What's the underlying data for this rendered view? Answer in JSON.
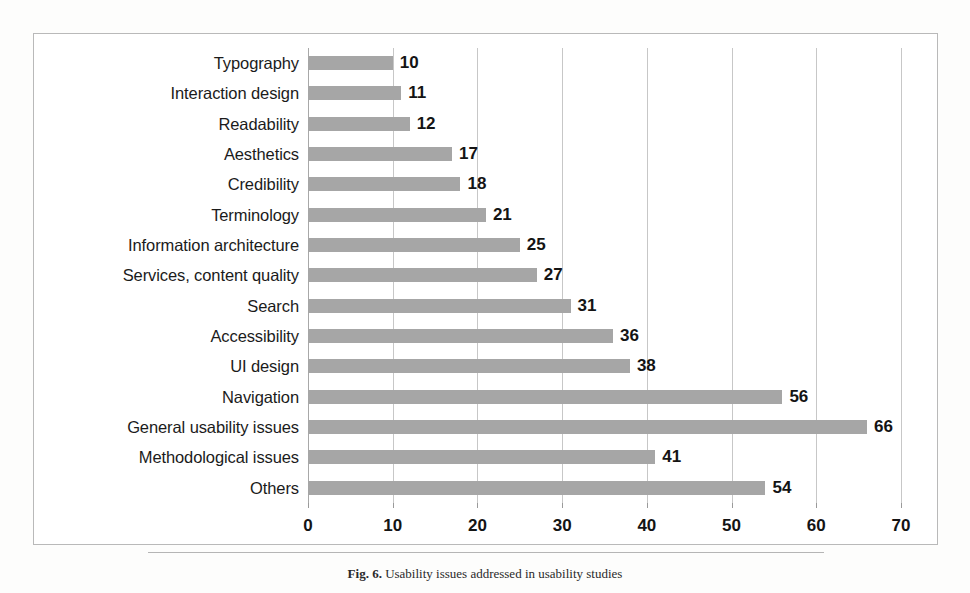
{
  "caption": {
    "figure_number": "Fig. 6.",
    "text": "Usability issues addressed in usability studies"
  },
  "chart_data": {
    "type": "bar",
    "orientation": "horizontal",
    "title": "",
    "xlabel": "",
    "ylabel": "",
    "xlim": [
      0,
      70
    ],
    "xticks": [
      0,
      10,
      20,
      30,
      40,
      50,
      60,
      70
    ],
    "grid": true,
    "legend": false,
    "bar_color": "#a6a6a6",
    "categories": [
      "Typography",
      "Interaction design",
      "Readability",
      "Aesthetics",
      "Credibility",
      "Terminology",
      "Information architecture",
      "Services, content quality",
      "Search",
      "Accessibility",
      "UI design",
      "Navigation",
      "General usability issues",
      "Methodological issues",
      "Others"
    ],
    "values": [
      10,
      11,
      12,
      17,
      18,
      21,
      25,
      27,
      31,
      36,
      38,
      56,
      66,
      41,
      54
    ]
  }
}
